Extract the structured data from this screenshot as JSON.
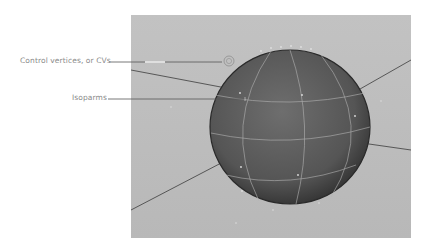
{
  "figure": {
    "callouts": [
      {
        "label": "Control vertices, or CVs",
        "target": "cv-point"
      },
      {
        "label": "Isoparms",
        "target": "isoparm-curve"
      }
    ]
  },
  "colors": {
    "viewport_bg": "#bdbdbd",
    "sphere_dark": "#3a3a3a",
    "sphere_mid": "#6a6a6a",
    "isoparm": "#b8b8b8",
    "axis_line": "#3c3c3c",
    "label_text": "#8a8a8a"
  }
}
